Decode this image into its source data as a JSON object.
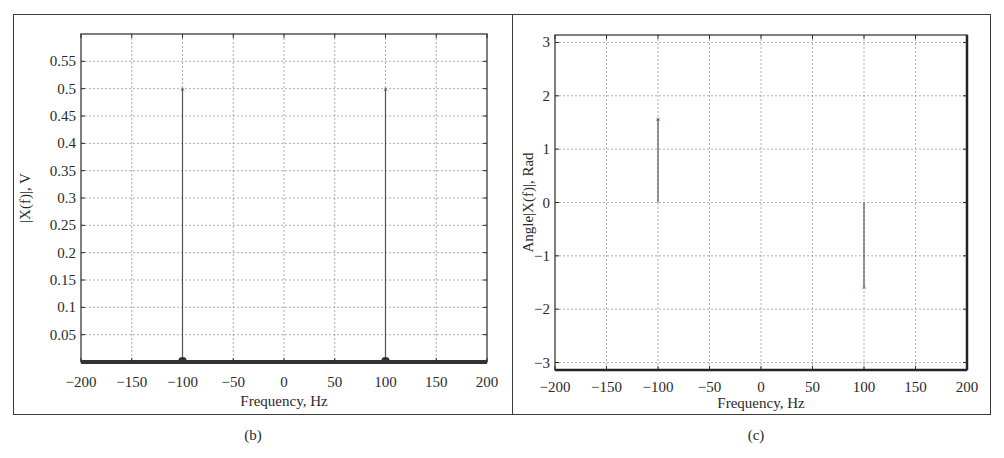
{
  "chart_data": [
    {
      "id": "b",
      "type": "stem",
      "caption": "(b)",
      "title": "",
      "xlabel": "Frequency, Hz",
      "ylabel": "|X(f)|, V",
      "xlim": [
        -200,
        200
      ],
      "ylim": [
        0,
        0.6
      ],
      "xticks": [
        -200,
        -150,
        -100,
        -50,
        0,
        50,
        100,
        150,
        200
      ],
      "xtick_labels": [
        "−200",
        "−150",
        "−100",
        "−50",
        "0",
        "50",
        "100",
        "150",
        "200"
      ],
      "yticks": [
        0.05,
        0.1,
        0.15,
        0.2,
        0.25,
        0.3,
        0.35,
        0.4,
        0.45,
        0.5,
        0.55
      ],
      "ytick_labels": [
        "0.05",
        "0.1",
        "0.15",
        "0.2",
        "0.25",
        "0.3",
        "0.35",
        "0.4",
        "0.45",
        "0.5",
        "0.55"
      ],
      "grid": true,
      "series": [
        {
          "name": "|X(f)|",
          "x": [
            -100,
            100
          ],
          "y": [
            0.5,
            0.5
          ],
          "baseline": 0
        }
      ]
    },
    {
      "id": "c",
      "type": "stem",
      "caption": "(c)",
      "title": "",
      "xlabel": "Frequency, Hz",
      "ylabel": "Angle[X(f)], Rad",
      "xlim": [
        -200,
        200
      ],
      "ylim": [
        -3.14,
        3.14
      ],
      "xticks": [
        -200,
        -150,
        -100,
        -50,
        0,
        50,
        100,
        150,
        200
      ],
      "xtick_labels": [
        "−200",
        "−150",
        "−100",
        "−50",
        "0",
        "50",
        "100",
        "150",
        "200"
      ],
      "yticks": [
        -3,
        -2,
        -1,
        0,
        1,
        2,
        3
      ],
      "ytick_labels": [
        "−3",
        "−2",
        "−1",
        "0",
        "1",
        "2",
        "3"
      ],
      "grid": true,
      "series": [
        {
          "name": "Angle X(f)",
          "x": [
            -100,
            100
          ],
          "y": [
            1.5708,
            -1.5708
          ],
          "baseline": 0
        }
      ]
    }
  ],
  "captions": {
    "left": "(b)",
    "right": "(c)"
  },
  "labels": {
    "left_xlabel": "Frequency, Hz",
    "left_ylabel": "|X(f)|, V",
    "right_xlabel": "Frequency, Hz",
    "right_ylabel": "Angle|X(f)|, Rad"
  },
  "colors": {
    "axis": "#2a2a2a",
    "grid": "#9a9a9a",
    "stem": "#555555",
    "background": "#ffffff"
  }
}
